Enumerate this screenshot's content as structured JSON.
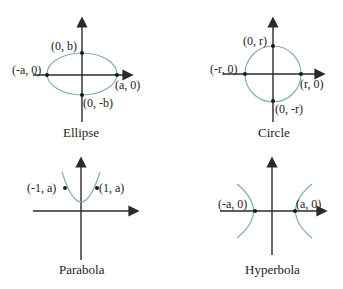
{
  "panels": {
    "ellipse": {
      "caption": "Ellipse",
      "labels": {
        "top": "(0, b)",
        "left": "(-a, 0)",
        "right": "(a, 0)",
        "bottom": "(0, -b)"
      }
    },
    "circle": {
      "caption": "Circle",
      "labels": {
        "top": "(0, r)",
        "left": "(-r, 0)",
        "right": "(r, 0)",
        "bottom": "(0, -r)"
      }
    },
    "parabola": {
      "caption": "Parabola",
      "labels": {
        "left": "(-1, a)",
        "right": "(1, a)"
      }
    },
    "hyperbola": {
      "caption": "Hyperbola",
      "labels": {
        "left": "(-a, 0)",
        "right": "(a, 0)"
      }
    }
  },
  "colors": {
    "curve": "#7fb3a3",
    "axis": "#2a2a2a"
  }
}
